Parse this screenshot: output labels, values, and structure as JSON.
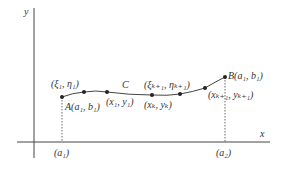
{
  "diagram": {
    "axes": {
      "x_label": "x",
      "y_label": "y"
    },
    "curve": {
      "name": "C"
    },
    "points": {
      "A": {
        "name": "A",
        "coords": "(a₁, b₁)"
      },
      "B": {
        "name": "B",
        "coords": "(a₁, b₁)"
      }
    },
    "labels": {
      "xi1": "(ξ₁, η₁)",
      "x1y1": "(x₁, y₁)",
      "xikp1": "(ξₖ₊₁, ηₖ₊₁)",
      "xkyk": "(xₖ, yₖ)",
      "xkp1": "(xₖ₊₁, yₖ₊₁)",
      "a1": "(a₁)",
      "a2": "(a₂)"
    },
    "colors": {
      "line": "#333333",
      "background": "#ffffff"
    }
  }
}
